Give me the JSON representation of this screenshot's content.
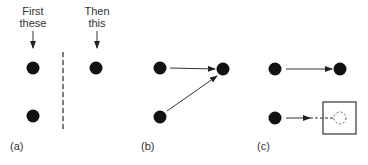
{
  "figure": {
    "panels": [
      {
        "id": "a",
        "label": "(a)",
        "captions": [
          {
            "line1": "First",
            "line2": "these"
          },
          {
            "line1": "Then",
            "line2": "this"
          }
        ],
        "description": "Two dots on the left shown first, then one dot on the right, separated by a dashed vertical line"
      },
      {
        "id": "b",
        "label": "(b)",
        "description": "Arrows from both left dots converge on the single right dot"
      },
      {
        "id": "c",
        "label": "(c)",
        "description": "Top dot arrows to right dot; bottom dot arrows via dashed line to a dashed circle inside a square"
      }
    ],
    "colors": {
      "dot": "#111111",
      "line": "#333333",
      "background": "#ffffff"
    }
  }
}
